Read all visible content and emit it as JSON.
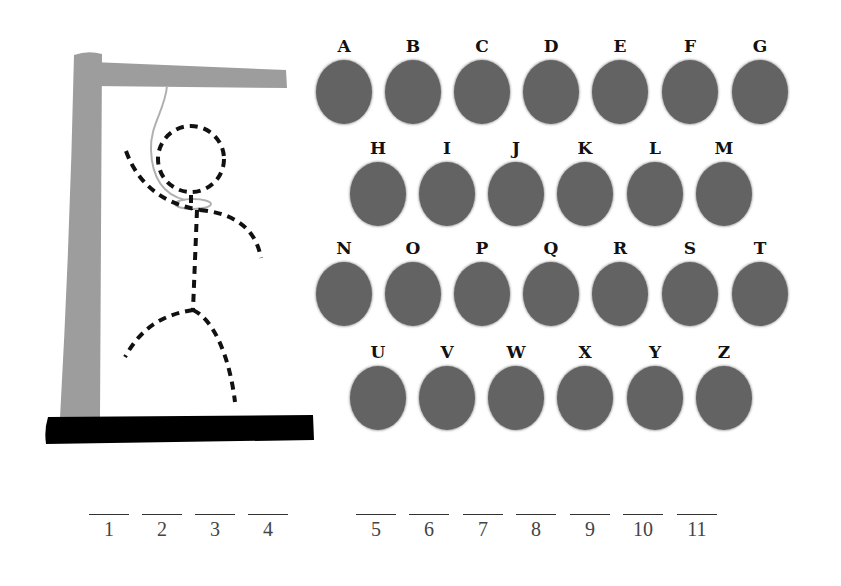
{
  "game": {
    "title": "Hangman",
    "colors": {
      "gallows_post": "#9d9d9d",
      "gallows_base": "#000000",
      "rope": "#b0b0b0",
      "figure_dash": "#111111",
      "letter_button": "#636363",
      "letter_label": "#111111",
      "blank_line": "#333333"
    },
    "figure": {
      "style": "dashed-stick-figure",
      "parts_shown": [
        "head",
        "body",
        "left-arm",
        "right-arm",
        "left-leg",
        "right-leg"
      ]
    },
    "letters": {
      "rows": [
        [
          "A",
          "B",
          "C",
          "D",
          "E",
          "F",
          "G"
        ],
        [
          "H",
          "I",
          "J",
          "K",
          "L",
          "M"
        ],
        [
          "N",
          "O",
          "P",
          "Q",
          "R",
          "S",
          "T"
        ],
        [
          "U",
          "V",
          "W",
          "X",
          "Y",
          "Z"
        ]
      ],
      "A": "A",
      "B": "B",
      "C": "C",
      "D": "D",
      "E": "E",
      "F": "F",
      "G": "G",
      "H": "H",
      "I": "I",
      "J": "J",
      "K": "K",
      "L": "L",
      "M": "M",
      "N": "N",
      "O": "O",
      "P": "P",
      "Q": "Q",
      "R": "R",
      "S": "S",
      "T": "T",
      "U": "U",
      "V": "V",
      "W": "W",
      "X": "X",
      "Y": "Y",
      "Z": "Z"
    },
    "word": {
      "words": [
        {
          "positions": [
            "1",
            "2",
            "3",
            "4"
          ]
        },
        {
          "positions": [
            "5",
            "6",
            "7",
            "8",
            "9",
            "10",
            "11"
          ]
        }
      ],
      "p1": "1",
      "p2": "2",
      "p3": "3",
      "p4": "4",
      "p5": "5",
      "p6": "6",
      "p7": "7",
      "p8": "8",
      "p9": "9",
      "p10": "10",
      "p11": "11",
      "total_letters": 11
    }
  }
}
